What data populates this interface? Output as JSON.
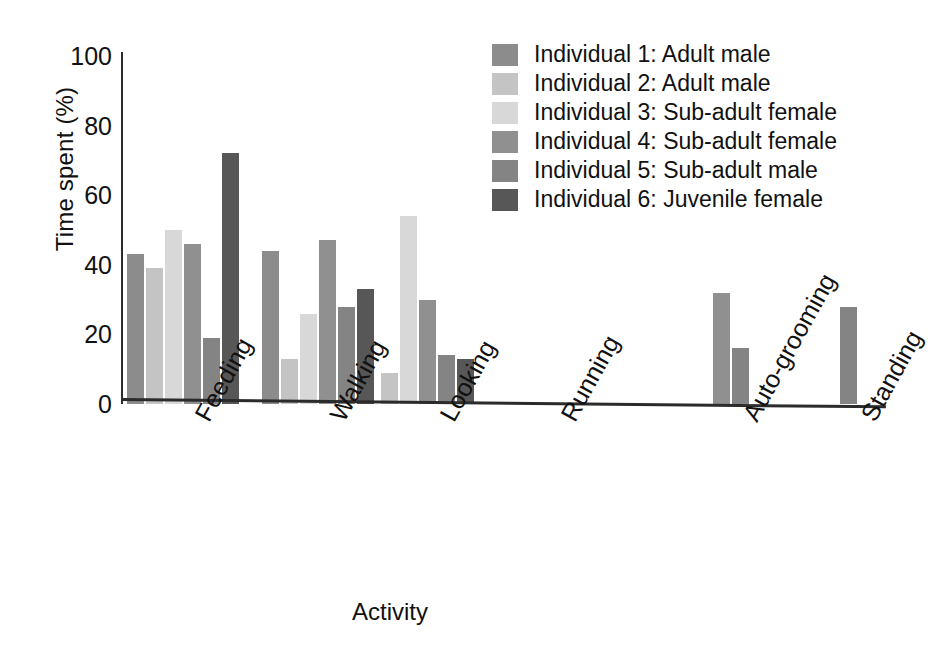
{
  "chart_data": {
    "type": "bar",
    "title": "",
    "xlabel": "Activity",
    "ylabel": "Time spent (%)",
    "ylim": [
      0,
      100
    ],
    "yticks": [
      0,
      20,
      40,
      60,
      80,
      100
    ],
    "grid": false,
    "legend_position": "top-right",
    "categories": [
      "Feeding",
      "Walking",
      "Looking",
      "Running",
      "Auto-grooming",
      "Standing"
    ],
    "series": [
      {
        "name": "Individual 1: Adult male",
        "color": "#8c8c8c",
        "values": [
          43,
          44,
          0,
          0,
          0,
          0
        ]
      },
      {
        "name": "Individual 2: Adult male",
        "color": "#c4c4c4",
        "values": [
          39,
          13,
          9,
          0,
          0,
          0
        ]
      },
      {
        "name": "Individual 3: Sub-adult female",
        "color": "#d8d8d8",
        "values": [
          50,
          26,
          54,
          0,
          0,
          0
        ]
      },
      {
        "name": "Individual 4: Sub-adult female",
        "color": "#909090",
        "values": [
          46,
          47,
          30,
          0,
          32,
          0
        ]
      },
      {
        "name": "Individual 5: Sub-adult male",
        "color": "#848484",
        "values": [
          19,
          28,
          14,
          0,
          16,
          28
        ]
      },
      {
        "name": "Individual 6: Juvenile female",
        "color": "#575757",
        "values": [
          72,
          33,
          13,
          0,
          0,
          0
        ]
      }
    ]
  },
  "axes": {
    "y_title": "Time spent (%)",
    "x_title": "Activity",
    "y_tick_labels": [
      "100",
      "80",
      "60",
      "40",
      "20",
      "0"
    ],
    "x_tick_labels": [
      "Feeding",
      "Walking",
      "Looking",
      "Running",
      "Auto-grooming",
      "Standing"
    ]
  },
  "legend": {
    "items": [
      {
        "label": "Individual 1: Adult male",
        "color": "#8c8c8c"
      },
      {
        "label": "Individual 2: Adult male",
        "color": "#c4c4c4"
      },
      {
        "label": "Individual 3: Sub-adult female",
        "color": "#d8d8d8"
      },
      {
        "label": "Individual 4: Sub-adult female",
        "color": "#909090"
      },
      {
        "label": "Individual 5: Sub-adult male",
        "color": "#848484"
      },
      {
        "label": "Individual 6: Juvenile female",
        "color": "#575757"
      }
    ]
  },
  "layout": {
    "baseline_y": 404,
    "top_y": 56,
    "px_per_unit": 3.48,
    "bar_width": 17,
    "group_starts": [
      127,
      262,
      381,
      540,
      713,
      840
    ]
  }
}
